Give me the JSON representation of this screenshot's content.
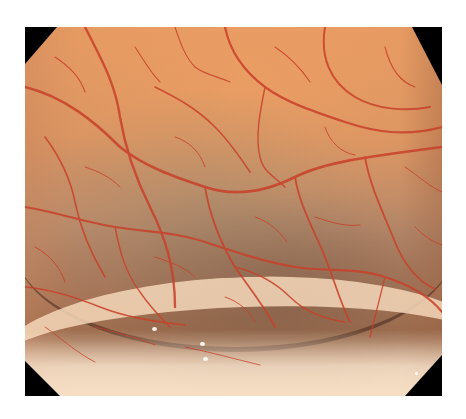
{
  "image": {
    "subject": "endoscopic view of colonic mucosa with visible vascular pattern",
    "alt": "Endoscopic image of colon mucosa showing red branching vessels over orange-tan mucosa with a haustral fold in the lower portion",
    "colors": {
      "mucosa": "#d9925e",
      "mucosa_highlight": "#e59a62",
      "shadow_region": "#9a6a4c",
      "vessel": "#c8402a",
      "fold_rim": "#f5d7b9",
      "corner_mask": "#000000",
      "background": "#ffffff"
    },
    "frame": {
      "left": 25,
      "top": 27,
      "width": 417,
      "height": 369
    }
  }
}
